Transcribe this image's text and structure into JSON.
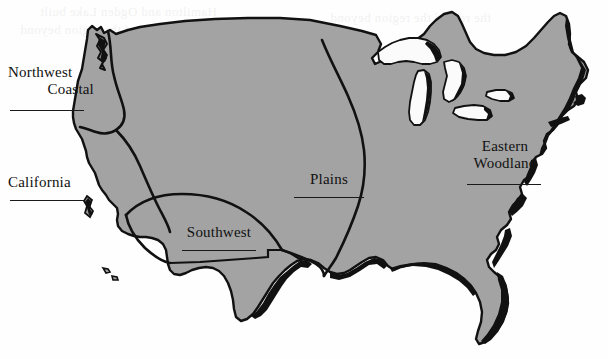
{
  "figure": {
    "type": "map",
    "land_fill_color": "#a3a3a3",
    "outline_color": "#111111",
    "background_color": "#fefefe",
    "lake_fill_color": "#fbfbfb"
  },
  "labels": [
    {
      "id": "northwest-coastal",
      "line1": "Northwest",
      "line2": "Coastal",
      "has_rule": true
    },
    {
      "id": "california",
      "line1": "California",
      "line2": "",
      "has_rule": true
    },
    {
      "id": "southwest",
      "line1": "Southwest",
      "line2": "",
      "has_rule": true
    },
    {
      "id": "plains",
      "line1": "Plains",
      "line2": "",
      "has_rule": true
    },
    {
      "id": "eastern-woodland",
      "line1": "Eastern",
      "line2": "Woodland",
      "has_rule": true
    }
  ],
  "ghost_text": {
    "line_a": "Hamilton and Ogden Lake built",
    "line_b": "the rest of the region beyond"
  }
}
